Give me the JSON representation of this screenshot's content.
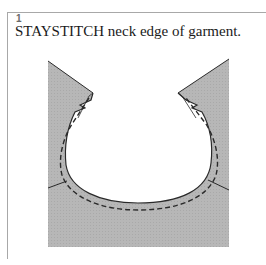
{
  "step": {
    "number": "1",
    "caption": "STAYSTITCH neck edge of garment."
  },
  "illustration": {
    "subject": "garment neckline with staystitching",
    "fabric_color": "#b7b7b7",
    "line_color": "#2a2a2a"
  }
}
